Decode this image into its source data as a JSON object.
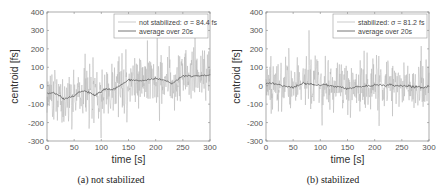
{
  "chart_data": [
    {
      "type": "line",
      "panel": "a",
      "caption": "(a) not stabilized",
      "xlabel": "time [s]",
      "ylabel": "centroid [fs]",
      "xlim": [
        0,
        300
      ],
      "ylim": [
        -300,
        400
      ],
      "xticks": [
        0,
        50,
        100,
        150,
        200,
        250,
        300
      ],
      "yticks": [
        -300,
        -200,
        -100,
        0,
        100,
        200,
        300,
        400
      ],
      "grid": false,
      "legend_position": "upper right",
      "series": [
        {
          "name": "not stabilized: σ = 84.4 fs",
          "kind": "raw",
          "color": "#b5b5b5",
          "std": 84.4,
          "seed": 7
        },
        {
          "name": "average over 20s",
          "kind": "average",
          "color": "#666666",
          "x": [
            0,
            10,
            20,
            30,
            40,
            50,
            60,
            70,
            80,
            90,
            100,
            110,
            120,
            130,
            140,
            150,
            160,
            170,
            180,
            190,
            200,
            210,
            220,
            230,
            240,
            250,
            260,
            270,
            280,
            290,
            300
          ],
          "values": [
            -40,
            -40,
            -45,
            -70,
            -65,
            -55,
            -35,
            -30,
            -40,
            -50,
            -30,
            -20,
            -20,
            -10,
            10,
            30,
            30,
            25,
            30,
            35,
            40,
            35,
            25,
            10,
            30,
            55,
            55,
            50,
            55,
            55,
            60
          ]
        }
      ]
    },
    {
      "type": "line",
      "panel": "b",
      "caption": "(b) stabilized",
      "xlabel": "time [s]",
      "ylabel": "centroid [fs]",
      "xlim": [
        0,
        300
      ],
      "ylim": [
        -300,
        400
      ],
      "xticks": [
        0,
        50,
        100,
        150,
        200,
        250,
        300
      ],
      "yticks": [
        -300,
        -200,
        -100,
        0,
        100,
        200,
        300,
        400
      ],
      "grid": false,
      "legend_position": "upper right",
      "series": [
        {
          "name": "stabilized: σ = 81.2 fs",
          "kind": "raw",
          "color": "#b5b5b5",
          "std": 81.2,
          "seed": 13
        },
        {
          "name": "average over 20s",
          "kind": "average",
          "color": "#666666",
          "x": [
            0,
            10,
            20,
            30,
            40,
            50,
            60,
            70,
            80,
            90,
            100,
            110,
            120,
            130,
            140,
            150,
            160,
            170,
            180,
            190,
            200,
            210,
            220,
            230,
            240,
            250,
            260,
            270,
            280,
            290,
            300
          ],
          "values": [
            10,
            15,
            10,
            0,
            -5,
            -10,
            0,
            15,
            10,
            5,
            0,
            5,
            0,
            -5,
            -10,
            -15,
            -10,
            -5,
            -5,
            0,
            5,
            5,
            0,
            5,
            0,
            0,
            0,
            -5,
            -5,
            -10,
            -5
          ]
        }
      ]
    }
  ]
}
